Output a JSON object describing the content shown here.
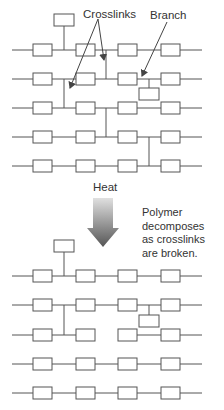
{
  "labels": {
    "crosslinks": "Crosslinks",
    "branch": "Branch",
    "heat": "Heat",
    "note_line1": "Polymer",
    "note_line2": "decomposes",
    "note_line3": "as crosslinks",
    "note_line4": "are broken."
  },
  "colors": {
    "line": "#555555",
    "box_stroke": "#555555",
    "arrow_top": "#d8d8d8",
    "arrow_bottom": "#555555"
  },
  "before": {
    "chains": 5,
    "boxes_per_chain": 4,
    "features": [
      "top pendant group",
      "crosslink chain1-chain2",
      "crosslink chain2-chain3",
      "branch on chain2",
      "crosslink chain3-chain4",
      "crosslink chain4-chain5"
    ]
  },
  "after": {
    "chains": 4,
    "boxes_per_chain": 4,
    "features": [
      "top pendant group",
      "crosslink chain1-chain2",
      "branch on chain1",
      "broken bond on chain2"
    ]
  }
}
